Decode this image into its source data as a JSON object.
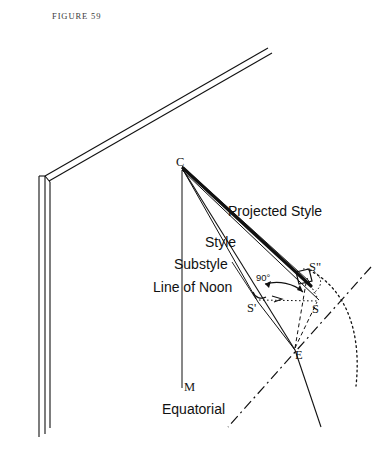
{
  "figure": {
    "caption": "FIGURE 59"
  },
  "diagram": {
    "labels": {
      "projected_style": "Projected Style",
      "style": "Style",
      "substyle": "Substyle",
      "line_of_noon": "Line of Noon",
      "equatorial": "Equatorial",
      "angle_right": "90°"
    },
    "points": {
      "c": "C",
      "m": "M",
      "e": "E",
      "s": "S",
      "s_prime": "S'",
      "s_double_prime": "S\""
    },
    "colors": {
      "ink": "#111111",
      "caption": "#3b3b3b",
      "paper": "#ffffff"
    }
  }
}
